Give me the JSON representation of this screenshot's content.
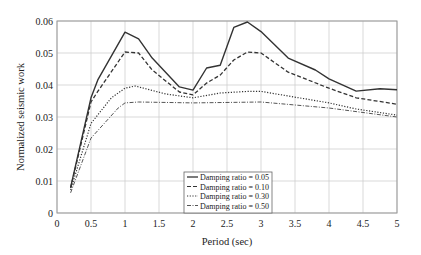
{
  "chart_data": {
    "type": "line",
    "title": "",
    "xlabel": "Period (sec)",
    "ylabel": "Normalized seismic work",
    "xlim": [
      0,
      5
    ],
    "ylim": [
      0,
      0.06
    ],
    "grid": true,
    "legend_position": "lower center (inside plot)",
    "x_ticks": [
      "0",
      "0.5",
      "1",
      "1.5",
      "2",
      "2.5",
      "3",
      "3.5",
      "4",
      "4.5",
      "5"
    ],
    "y_ticks": [
      "0",
      "0.01",
      "0.02",
      "0.03",
      "0.04",
      "0.05",
      "0.06"
    ],
    "series": [
      {
        "name": "Damping ratio = 0.05",
        "style": "solid",
        "x": [
          0.2,
          0.5,
          0.6,
          1.0,
          1.2,
          1.4,
          1.8,
          2.0,
          2.2,
          2.4,
          2.6,
          2.8,
          3.0,
          3.4,
          3.8,
          4.0,
          4.4,
          4.75,
          5.0
        ],
        "values": [
          0.008,
          0.036,
          0.0416,
          0.0565,
          0.0544,
          0.0484,
          0.0394,
          0.0384,
          0.0453,
          0.0462,
          0.058,
          0.0597,
          0.0567,
          0.0484,
          0.0447,
          0.0419,
          0.0381,
          0.0388,
          0.0385
        ]
      },
      {
        "name": "Damping ratio = 0.10",
        "style": "dashed",
        "x": [
          0.2,
          0.5,
          0.6,
          1.0,
          1.2,
          1.4,
          1.8,
          2.0,
          2.2,
          2.4,
          2.6,
          2.8,
          3.0,
          3.4,
          4.0,
          4.4,
          5.0
        ],
        "values": [
          0.0078,
          0.0347,
          0.038,
          0.0503,
          0.05,
          0.0447,
          0.0378,
          0.0369,
          0.0406,
          0.0431,
          0.0478,
          0.0503,
          0.05,
          0.044,
          0.039,
          0.036,
          0.034
        ]
      },
      {
        "name": "Damping ratio = 0.30",
        "style": "dotted",
        "x": [
          0.2,
          0.5,
          0.8,
          1.0,
          1.15,
          1.6,
          2.0,
          2.4,
          2.8,
          3.0,
          4.0,
          4.4,
          5.0
        ],
        "values": [
          0.0072,
          0.028,
          0.036,
          0.039,
          0.0397,
          0.0372,
          0.036,
          0.0375,
          0.038,
          0.038,
          0.0344,
          0.0325,
          0.0306
        ]
      },
      {
        "name": "Damping ratio = 0.50",
        "style": "dashdot",
        "x": [
          0.2,
          0.5,
          0.9,
          1.0,
          1.2,
          2.0,
          3.0,
          4.0,
          5.0
        ],
        "values": [
          0.0063,
          0.0234,
          0.0328,
          0.0344,
          0.0347,
          0.0344,
          0.0347,
          0.0328,
          0.03
        ]
      }
    ]
  },
  "legend": {
    "items": [
      "Damping ratio = 0.05",
      "Damping ratio = 0.10",
      "Damping ratio = 0.30",
      "Damping ratio = 0.50"
    ]
  },
  "axes": {
    "xlabel": "Period (sec)",
    "ylabel": "Normalized seismic work"
  },
  "colors": {
    "line": "#333333",
    "grid": "#cfcfcf",
    "frame": "#999999"
  }
}
